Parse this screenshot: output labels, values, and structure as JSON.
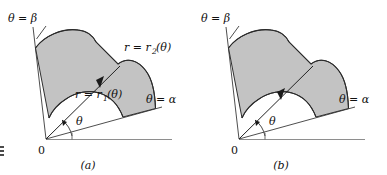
{
  "figure": {
    "kind": "polar-region-diagram",
    "background_color": "#ffffff",
    "shade_color": "#c3c3c3",
    "outline_color": "#2f2f2f",
    "axis_color": "#8e8e8e",
    "panels": [
      {
        "id": "a",
        "caption": "(a)",
        "origin_label": "0",
        "theta_label": "θ",
        "ray_beta_label": "θ = β",
        "ray_alpha_label": "θ = α",
        "inner_curve_label": "r = r",
        "inner_curve_sub": "1",
        "inner_curve_arg": "(θ)",
        "outer_curve_label": "r = r",
        "outer_curve_sub": "2",
        "outer_curve_arg": "(θ)",
        "has_curve_labels": true
      },
      {
        "id": "b",
        "caption": "(b)",
        "origin_label": "0",
        "theta_label": "θ",
        "ray_beta_label": "θ = β",
        "ray_alpha_label": "θ = α",
        "inner_curve_label": "",
        "inner_curve_sub": "",
        "inner_curve_arg": "",
        "outer_curve_label": "",
        "outer_curve_sub": "",
        "outer_curve_arg": "",
        "has_curve_labels": false
      }
    ]
  }
}
